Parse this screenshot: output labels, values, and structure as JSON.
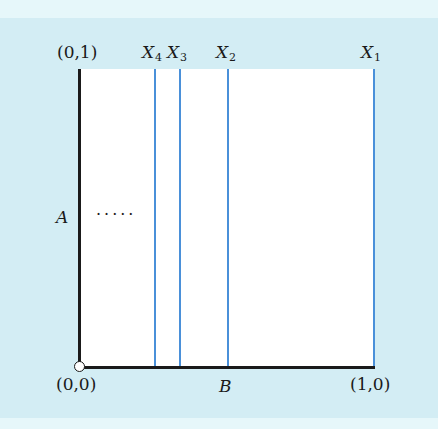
{
  "diagram": {
    "colors": {
      "background": "#d3edf4",
      "plot_area": "#ffffff",
      "axis": "#1a1a1a",
      "partition_line": "#4a90d9"
    },
    "corner_labels": {
      "top_left": "(0,1)",
      "bottom_left": "(0,0)",
      "bottom_right": "(1,0)"
    },
    "axis_labels": {
      "vertical": "A",
      "horizontal": "B"
    },
    "ellipsis": "·····",
    "partition_lines": [
      {
        "name": "X",
        "sub": "4",
        "x": 155
      },
      {
        "name": "X",
        "sub": "3",
        "x": 180
      },
      {
        "name": "X",
        "sub": "2",
        "x": 228
      },
      {
        "name": "X",
        "sub": "1",
        "x": 374
      }
    ]
  }
}
